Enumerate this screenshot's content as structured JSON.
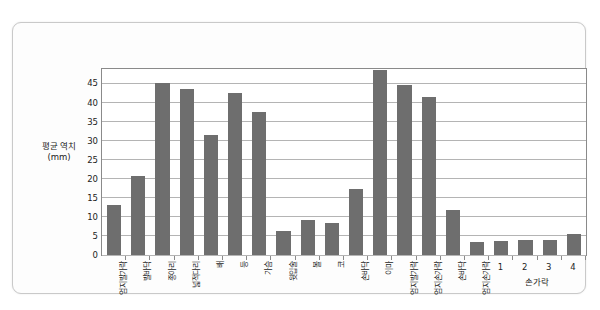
{
  "chart_data": {
    "type": "bar",
    "title": "",
    "xlabel": "",
    "ylabel": "평균 역치",
    "ylabel_unit": "(mm)",
    "ylim": [
      0,
      48.8
    ],
    "yticks": [
      0,
      5,
      10,
      15,
      20,
      25,
      30,
      35,
      40,
      45
    ],
    "grid": true,
    "legend": null,
    "bar_color": "#6e6e6e",
    "categories": [
      "엄지발가락",
      "발바닥",
      "종아리",
      "넓적다리",
      "배",
      "등",
      "가슴",
      "윗입술",
      "볼",
      "코",
      "손바닥",
      "이마",
      "엄지발가락",
      "엄지손가락",
      "손바닥",
      "엄지손가락",
      "1",
      "2",
      "3",
      "4"
    ],
    "values": [
      13.0,
      20.8,
      45.2,
      43.6,
      31.5,
      42.4,
      37.6,
      6.3,
      9.2,
      8.3,
      17.2,
      48.5,
      44.6,
      41.5,
      11.7,
      3.4,
      3.8,
      4.0,
      4.0,
      5.5
    ],
    "group_label": "손가락",
    "group_label_members": [
      "1",
      "2",
      "3",
      "4"
    ]
  },
  "axis": {
    "y_title_main": "평균 역치",
    "y_title_unit": "(mm)"
  }
}
